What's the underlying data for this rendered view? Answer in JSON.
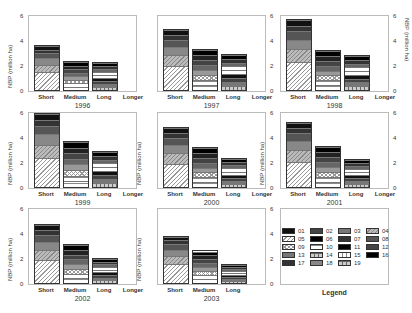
{
  "chart_data": [
    {
      "type": "bar",
      "stacked": true,
      "title": "1996",
      "ylabel": "NBP (million ha)",
      "ylim": [
        0,
        6
      ],
      "yticks": [
        0,
        2,
        4,
        6
      ],
      "categories": [
        "Short",
        "Medium",
        "Long",
        "Longer"
      ],
      "totals": [
        3.7,
        2.4,
        2.3,
        0
      ],
      "axis_side": "left"
    },
    {
      "type": "bar",
      "stacked": true,
      "title": "1997",
      "ylabel": "",
      "ylim": [
        0,
        6
      ],
      "yticks": [
        0,
        2,
        4,
        6
      ],
      "categories": [
        "Short",
        "Medium",
        "Long",
        "Longer"
      ],
      "totals": [
        5.0,
        3.4,
        3.0,
        0
      ],
      "axis_side": "right"
    },
    {
      "type": "bar",
      "stacked": true,
      "title": "1998",
      "ylabel": "NBP (million ha)",
      "ylim": [
        0,
        6
      ],
      "yticks": [
        0,
        2,
        4,
        6
      ],
      "categories": [
        "Short",
        "Medium",
        "Long",
        "Longer"
      ],
      "totals": [
        5.8,
        3.3,
        2.9,
        0
      ],
      "axis_side": "right"
    },
    {
      "type": "bar",
      "stacked": true,
      "title": "1999",
      "ylabel": "NBP (million ha)",
      "ylim": [
        0,
        7
      ],
      "yticks": [
        0,
        2,
        4,
        6
      ],
      "categories": [
        "Short",
        "Medium",
        "Long",
        "Longer"
      ],
      "totals": [
        6.6,
        3.8,
        3.0,
        0
      ],
      "axis_side": "left"
    },
    {
      "type": "bar",
      "stacked": true,
      "title": "2000",
      "ylabel": "NBP (million ha)",
      "ylim": [
        0,
        6
      ],
      "yticks": [
        0,
        2,
        4,
        6
      ],
      "categories": [
        "Short",
        "Medium",
        "Long",
        "Longer"
      ],
      "totals": [
        4.9,
        3.3,
        2.4,
        0
      ],
      "axis_side": "right"
    },
    {
      "type": "bar",
      "stacked": true,
      "title": "2001",
      "ylabel": "NBP (million ha)",
      "ylim": [
        0,
        6
      ],
      "yticks": [
        0,
        2,
        4,
        6
      ],
      "categories": [
        "Short",
        "Medium",
        "Long",
        "Longer"
      ],
      "totals": [
        5.3,
        3.4,
        2.3,
        0
      ],
      "axis_side": "right"
    },
    {
      "type": "bar",
      "stacked": true,
      "title": "2002",
      "ylabel": "NBP (million ha)",
      "ylim": [
        0,
        6
      ],
      "yticks": [
        0,
        2,
        4,
        6
      ],
      "categories": [
        "Short",
        "Medium",
        "Long",
        "Longer"
      ],
      "totals": [
        4.8,
        3.2,
        2.1,
        0
      ],
      "axis_side": "left"
    },
    {
      "type": "bar",
      "stacked": true,
      "title": "2003",
      "ylabel": "NBP (million ha)",
      "ylim": [
        0,
        6
      ],
      "yticks": [
        0,
        2,
        4,
        6
      ],
      "categories": [
        "Short",
        "Medium",
        "Long"
      ],
      "totals": [
        3.9,
        2.7,
        1.6
      ],
      "axis_side": "right"
    }
  ],
  "legend": {
    "title": "Legend",
    "items": [
      "01",
      "02",
      "03",
      "04",
      "05",
      "06",
      "07",
      "08",
      "09",
      "10",
      "11",
      "12",
      "13",
      "14",
      "15",
      "16",
      "17",
      "18",
      "19"
    ]
  }
}
